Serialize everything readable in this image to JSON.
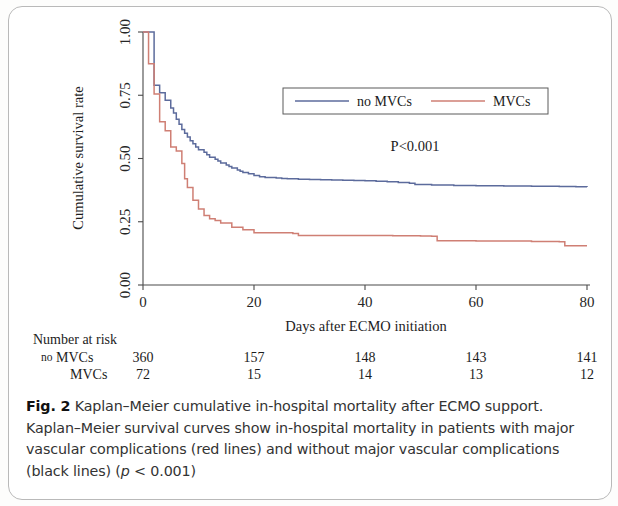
{
  "figure": {
    "frame_visible": true,
    "caption_label": "Fig. 2",
    "caption_text": " Kaplan–Meier cumulative in-hospital mortality after ECMO support. Kaplan–Meier survival curves show in-hospital mortality in patients with major vascular complications (red lines) and without major vascular complications (black lines) (",
    "caption_p_italic": "p",
    "caption_p_rest": " < 0.001)"
  },
  "annotations": {
    "pvalue": "P<0.001"
  },
  "risk_table": {
    "title": "Number at risk",
    "row_prefix": "no",
    "rows": [
      {
        "label": "MVCs",
        "prefix": "no",
        "values": [
          "360",
          "157",
          "148",
          "143",
          "141"
        ]
      },
      {
        "label": "MVCs",
        "prefix": "",
        "values": [
          "72",
          "15",
          "14",
          "13",
          "12"
        ]
      }
    ],
    "times": [
      0,
      20,
      40,
      60,
      80
    ]
  },
  "chart_data": {
    "type": "line",
    "subtype": "kaplan-meier-step",
    "title": "",
    "xlabel": "Days after ECMO initiation",
    "ylabel": "Cumulative survival rate",
    "xlim": [
      0,
      80
    ],
    "ylim": [
      0,
      1.0
    ],
    "xticks": [
      0,
      20,
      40,
      60,
      80
    ],
    "xtick_labels": [
      "0",
      "20",
      "40",
      "60",
      "80"
    ],
    "yticks": [
      0.0,
      0.25,
      0.5,
      0.75,
      1.0
    ],
    "ytick_labels": [
      "0.00",
      "0.25",
      "0.50",
      "0.75",
      "1.00"
    ],
    "grid": false,
    "legend_position": "top-center",
    "colors": {
      "no_mvcs": "#5c6b9c",
      "mvcs": "#cf7f74"
    },
    "series": [
      {
        "name": "no MVCs",
        "key": "no_mvcs",
        "color": "#5c6b9c",
        "n_at_risk_start": 360,
        "points": [
          [
            0,
            1.0
          ],
          [
            2,
            1.0
          ],
          [
            2,
            0.79
          ],
          [
            3,
            0.76
          ],
          [
            4,
            0.73
          ],
          [
            5,
            0.7
          ],
          [
            5.5,
            0.68
          ],
          [
            6,
            0.655
          ],
          [
            6.5,
            0.635
          ],
          [
            7,
            0.615
          ],
          [
            7.5,
            0.6
          ],
          [
            8,
            0.585
          ],
          [
            8.5,
            0.57
          ],
          [
            9,
            0.558
          ],
          [
            9.5,
            0.545
          ],
          [
            10,
            0.535
          ],
          [
            11,
            0.525
          ],
          [
            11.5,
            0.515
          ],
          [
            12,
            0.505
          ],
          [
            13,
            0.497
          ],
          [
            13.5,
            0.49
          ],
          [
            14,
            0.482
          ],
          [
            15,
            0.474
          ],
          [
            15.5,
            0.468
          ],
          [
            16,
            0.462
          ],
          [
            17,
            0.455
          ],
          [
            17.5,
            0.45
          ],
          [
            18,
            0.445
          ],
          [
            19,
            0.44
          ],
          [
            20,
            0.433
          ],
          [
            21,
            0.428
          ],
          [
            22,
            0.425
          ],
          [
            24,
            0.423
          ],
          [
            25,
            0.421
          ],
          [
            26,
            0.42
          ],
          [
            28,
            0.418
          ],
          [
            30,
            0.417
          ],
          [
            32,
            0.416
          ],
          [
            34,
            0.415
          ],
          [
            36,
            0.414
          ],
          [
            38,
            0.413
          ],
          [
            40,
            0.412
          ],
          [
            42,
            0.41
          ],
          [
            44,
            0.408
          ],
          [
            46,
            0.405
          ],
          [
            48,
            0.402
          ],
          [
            49,
            0.397
          ],
          [
            52,
            0.395
          ],
          [
            56,
            0.393
          ],
          [
            60,
            0.392
          ],
          [
            65,
            0.391
          ],
          [
            70,
            0.39
          ],
          [
            75,
            0.389
          ],
          [
            78,
            0.388
          ],
          [
            80,
            0.387
          ]
        ]
      },
      {
        "name": "MVCs",
        "key": "mvcs",
        "color": "#cf7f74",
        "n_at_risk_start": 72,
        "points": [
          [
            0,
            1.0
          ],
          [
            1,
            1.0
          ],
          [
            1,
            0.875
          ],
          [
            2,
            0.875
          ],
          [
            2,
            0.755
          ],
          [
            3,
            0.755
          ],
          [
            3,
            0.645
          ],
          [
            4,
            0.645
          ],
          [
            4,
            0.61
          ],
          [
            5,
            0.61
          ],
          [
            5,
            0.545
          ],
          [
            6,
            0.545
          ],
          [
            6,
            0.53
          ],
          [
            7,
            0.53
          ],
          [
            7,
            0.48
          ],
          [
            7.5,
            0.48
          ],
          [
            7.5,
            0.42
          ],
          [
            8,
            0.42
          ],
          [
            8,
            0.385
          ],
          [
            9,
            0.385
          ],
          [
            9,
            0.335
          ],
          [
            10,
            0.335
          ],
          [
            10,
            0.3
          ],
          [
            11,
            0.3
          ],
          [
            11,
            0.275
          ],
          [
            12,
            0.275
          ],
          [
            12,
            0.262
          ],
          [
            13,
            0.262
          ],
          [
            13,
            0.255
          ],
          [
            14,
            0.255
          ],
          [
            14,
            0.245
          ],
          [
            16,
            0.245
          ],
          [
            16,
            0.228
          ],
          [
            18,
            0.228
          ],
          [
            18,
            0.218
          ],
          [
            20,
            0.218
          ],
          [
            20,
            0.207
          ],
          [
            27,
            0.207
          ],
          [
            27,
            0.204
          ],
          [
            28,
            0.204
          ],
          [
            28,
            0.196
          ],
          [
            40,
            0.196
          ],
          [
            45,
            0.195
          ],
          [
            50,
            0.194
          ],
          [
            52,
            0.193
          ],
          [
            53,
            0.175
          ],
          [
            60,
            0.174
          ],
          [
            70,
            0.172
          ],
          [
            75,
            0.171
          ],
          [
            76,
            0.155
          ],
          [
            80,
            0.155
          ]
        ]
      }
    ],
    "legend": [
      {
        "label": "no MVCs",
        "color": "#5c6b9c"
      },
      {
        "label": "MVCs",
        "color": "#cf7f74"
      }
    ]
  }
}
